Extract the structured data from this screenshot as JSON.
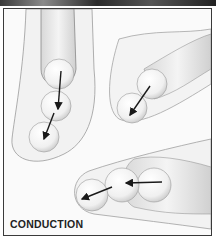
{
  "figure": {
    "caption": "CONDUCTION",
    "groups": [
      {
        "name": "left-chain",
        "balls": 3,
        "arrows": 2,
        "direction": "down-left"
      },
      {
        "name": "middle-chain",
        "balls": 2,
        "arrows": 1,
        "direction": "down-left"
      },
      {
        "name": "bottom-chain",
        "balls": 3,
        "arrows": 2,
        "direction": "left"
      }
    ],
    "colors": {
      "border": "#3a3a3a",
      "background": "#fafafa",
      "arrow": "#1a1a1a",
      "shade": "#cfcfcf"
    }
  }
}
